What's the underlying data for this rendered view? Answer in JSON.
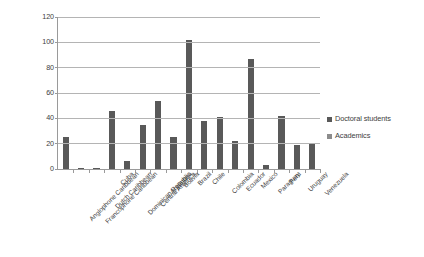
{
  "chart_data": {
    "type": "bar",
    "title": "",
    "xlabel": "",
    "ylabel": "",
    "ylim": [
      0,
      120
    ],
    "ytick_step": 20,
    "yticks": [
      0,
      20,
      40,
      60,
      80,
      100,
      120
    ],
    "grid": true,
    "legend_position": "right",
    "categories": [
      "Anglophone Caribbean",
      "Francophone Caribbean",
      "Dutch Caribbean",
      "Cuba",
      "Dominican Republic",
      "Central America",
      "Argentina",
      "Bolivia",
      "Brazil",
      "Chile",
      "Colombia",
      "Ecuador",
      "Mexico",
      "Paraguay",
      "Peru",
      "Uruguay",
      "Venezuela"
    ],
    "series": [
      {
        "name": "Doctoral students",
        "color": "#595959",
        "values": [
          25,
          0.6,
          0.7,
          46,
          6,
          35,
          54,
          25,
          102,
          38,
          41,
          22,
          87,
          3,
          42,
          19,
          20
        ]
      },
      {
        "name": "Academics",
        "color": "#8c8c8c",
        "values": [
          0,
          0,
          0,
          0,
          0,
          0,
          0,
          0,
          0,
          0,
          0,
          0,
          0,
          0,
          0,
          0,
          0
        ]
      }
    ]
  },
  "legend": {
    "items": [
      {
        "label": "Doctoral students",
        "color": "#595959"
      },
      {
        "label": "Academics",
        "color": "#8c8c8c"
      }
    ]
  },
  "axes": {
    "y_tick_labels": [
      "120",
      "100",
      "80",
      "60",
      "40",
      "20",
      "0"
    ]
  }
}
